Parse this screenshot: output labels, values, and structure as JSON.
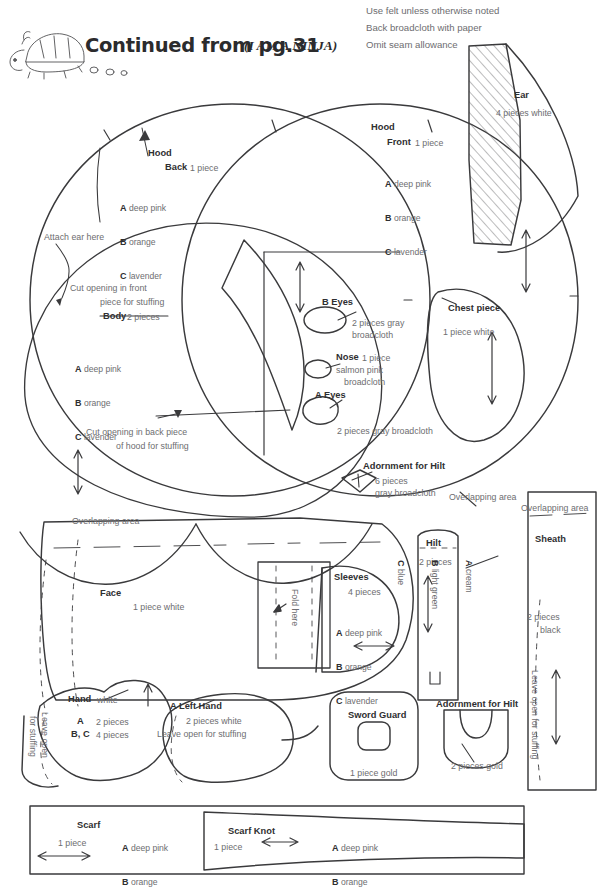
{
  "header": {
    "title": "Continued from pg.31",
    "subtitle": "(I AM A NINJA)",
    "mascot": "turtle-doodle"
  },
  "instructions": [
    "Use felt unless otherwise noted",
    "Back broadcloth with paper",
    "Omit seam allowance"
  ],
  "pieces": {
    "ear": {
      "name": "Ear",
      "qty": "4 pieces white"
    },
    "hood_back": {
      "name": "Hood",
      "sub": "Back",
      "qty": "1 piece",
      "colors": [
        {
          "key": "A",
          "value": "deep pink"
        },
        {
          "key": "B",
          "value": "orange"
        },
        {
          "key": "C",
          "value": "lavender"
        }
      ]
    },
    "hood_front": {
      "name": "Hood",
      "sub": "Front",
      "qty": "1 piece",
      "colors": [
        {
          "key": "A",
          "value": "deep pink"
        },
        {
          "key": "B",
          "value": "orange"
        },
        {
          "key": "C",
          "value": "lavender"
        }
      ]
    },
    "body": {
      "name": "Body",
      "qty": "2 pieces",
      "colors": [
        {
          "key": "A",
          "value": "deep pink"
        },
        {
          "key": "B",
          "value": "orange"
        },
        {
          "key": "C",
          "value": "lavender"
        }
      ]
    },
    "b_eyes": {
      "name": "B Eyes",
      "qty": "2 pieces gray",
      "qty2": "broadcloth"
    },
    "nose": {
      "name": "Nose",
      "qty": "1 piece",
      "qty2": "salmon pink",
      "qty3": "broadcloth"
    },
    "a_eyes": {
      "name": "A Eyes",
      "qty": "2 pieces gray broadcloth"
    },
    "chest": {
      "name": "Chest piece",
      "qty": "1 piece white"
    },
    "adornment_top": {
      "name": "Adornment for Hilt",
      "qty": "6 pieces",
      "qty2": "gray broadcloth"
    },
    "face": {
      "name": "Face",
      "qty": "1 piece white"
    },
    "sleeves": {
      "name": "Sleeves",
      "qty": "4 pieces",
      "colors": [
        {
          "key": "A",
          "value": "deep pink"
        },
        {
          "key": "B",
          "value": "orange"
        },
        {
          "key": "C",
          "value": "lavender"
        }
      ]
    },
    "hilt": {
      "name": "Hilt",
      "qty": "2 pieces",
      "colors": [
        {
          "key": "A",
          "value": "cream"
        },
        {
          "key": "B",
          "value": "light green"
        },
        {
          "key": "C",
          "value": "blue"
        }
      ]
    },
    "sheath": {
      "name": "Sheath",
      "qty": "2 pieces",
      "qty2": "black"
    },
    "hand": {
      "name": "Hand",
      "material": "white",
      "qty_a": "A",
      "qty_a_val": "2 pieces",
      "qty_bc": "B, C",
      "qty_bc_val": "4 pieces"
    },
    "left_hand": {
      "name": "A Left Hand",
      "qty": "2 pieces white",
      "note": "Leave open for stuffing"
    },
    "sword_guard": {
      "name": "Sword Guard",
      "qty": "1 piece gold"
    },
    "adornment_bottom": {
      "name": "Adornment for Hilt",
      "qty": "2 pieces gold"
    },
    "scarf": {
      "name": "Scarf",
      "qty": "1 piece",
      "colors": [
        {
          "key": "A",
          "value": "deep pink"
        },
        {
          "key": "B",
          "value": "orange"
        },
        {
          "key": "C",
          "value": "lavender"
        }
      ]
    },
    "scarf_knot": {
      "name": "Scarf Knot",
      "qty": "1 piece",
      "colors": [
        {
          "key": "A",
          "value": "deep pink"
        },
        {
          "key": "B",
          "value": "orange"
        },
        {
          "key": "C",
          "value": "lavender"
        }
      ]
    }
  },
  "annotations": {
    "attach_ear": "Attach ear here",
    "cut_front_1": "Cut opening in front",
    "cut_front_2": "piece for stuffing",
    "cut_back_1": "Cut opening in back piece",
    "cut_back_2": "of hood for stuffing",
    "overlapping_1": "Overlapping area",
    "overlapping_2": "Overlapping area",
    "overlapping_3": "Overlapping area",
    "fold_here": "Fold here",
    "leave_open_sheath": "Leave open for stuffing",
    "leave_open_hand": "Leave open",
    "leave_open_hand_2": "for stuffing"
  },
  "colors": {
    "ink": "#3a3a3c",
    "text_gray": "#6d6d70",
    "text_dark": "#2b2b2d",
    "paper": "#ffffff"
  }
}
